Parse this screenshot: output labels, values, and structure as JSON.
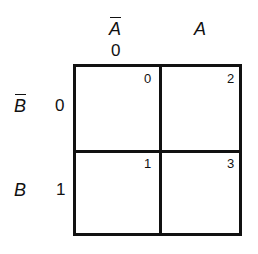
{
  "kmap": {
    "columns": [
      {
        "variable": "A",
        "negated": true,
        "code": "0"
      },
      {
        "variable": "A",
        "negated": false,
        "code": ""
      }
    ],
    "rows": [
      {
        "variable": "B",
        "negated": true,
        "code": "0"
      },
      {
        "variable": "B",
        "negated": false,
        "code": "1"
      }
    ],
    "cells": [
      {
        "row": 0,
        "col": 0,
        "index": "0"
      },
      {
        "row": 0,
        "col": 1,
        "index": "2"
      },
      {
        "row": 1,
        "col": 0,
        "index": "1"
      },
      {
        "row": 1,
        "col": 1,
        "index": "3"
      }
    ],
    "line_color": "#111111"
  }
}
